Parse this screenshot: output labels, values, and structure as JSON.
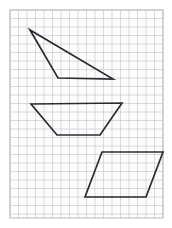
{
  "figure": {
    "canvas": {
      "width": 172,
      "height": 228,
      "background": "#ffffff"
    },
    "grid": {
      "name": "graph-paper-grid",
      "x": 10,
      "y": 10,
      "width": 153,
      "height": 208,
      "cell_size": 8.5,
      "columns": 18,
      "rows": 24,
      "line_color": "#c9c9cf",
      "line_width": 0.7,
      "border_color": "#b4b4bb",
      "border_width": 0.9,
      "fill": "#fdfdfd"
    },
    "shapes": [
      {
        "name": "triangle",
        "label": "Triangle",
        "stroke": "#2b2b33",
        "stroke_width": 1.7,
        "fill": "none",
        "points": "30,30 58,78 113,79"
      },
      {
        "name": "trapezoid",
        "label": "Trapezoid",
        "stroke": "#2b2b33",
        "stroke_width": 1.7,
        "fill": "none",
        "points": "31,104 122,103 100,135 57,135"
      },
      {
        "name": "parallelogram",
        "label": "Parallelogram",
        "stroke": "#2b2b33",
        "stroke_width": 1.7,
        "fill": "none",
        "points": "102,152 163,152 146,197 85,197"
      }
    ]
  }
}
